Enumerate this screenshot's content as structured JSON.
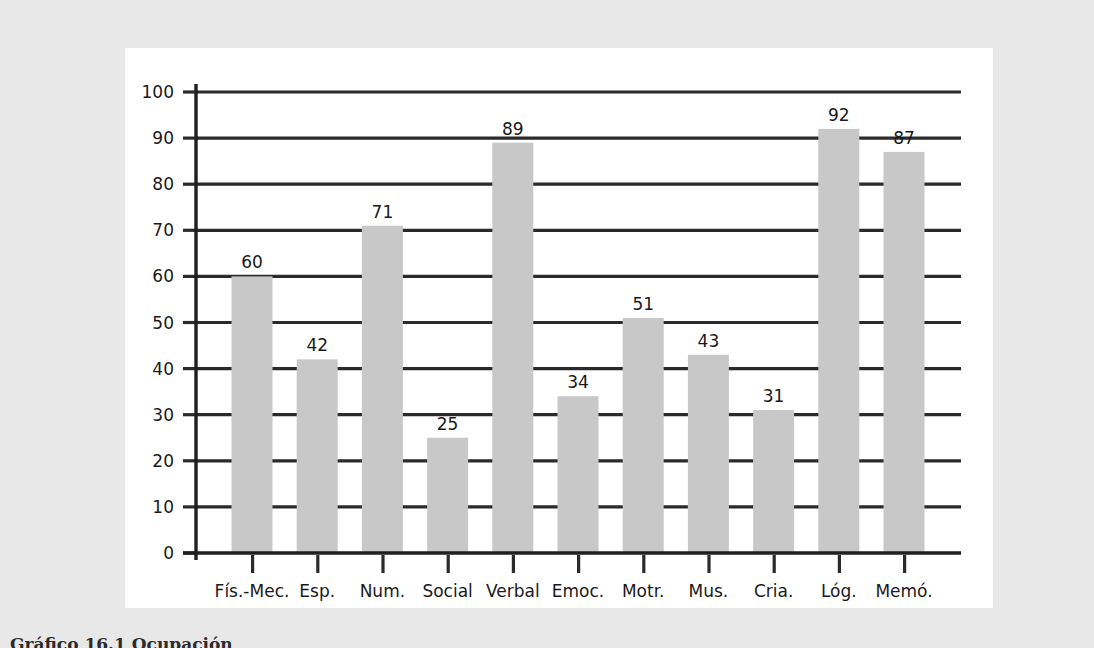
{
  "chart_data": {
    "type": "bar",
    "title": "",
    "xlabel": "",
    "ylabel": "",
    "ylim": [
      0,
      100
    ],
    "ytick_step": 10,
    "grid": true,
    "legend": false,
    "bar_color": "#c8c8c8",
    "axis_color": "#1f1f1f",
    "categories": [
      "Fís.-Mec.",
      "Esp.",
      "Num.",
      "Social",
      "Verbal",
      "Emoc.",
      "Motr.",
      "Mus.",
      "Cria.",
      "Lóg.",
      "Memó."
    ],
    "values": [
      60,
      42,
      71,
      25,
      89,
      34,
      51,
      43,
      31,
      92,
      87
    ],
    "value_labels": [
      "60",
      "42",
      "71",
      "25",
      "89",
      "34",
      "51",
      "43",
      "31",
      "92",
      "87"
    ],
    "ytick_labels": [
      "0",
      "10",
      "20",
      "30",
      "40",
      "50",
      "60",
      "70",
      "80",
      "90",
      "100"
    ],
    "ytick_values": [
      0,
      10,
      20,
      30,
      40,
      50,
      60,
      70,
      80,
      90,
      100
    ]
  },
  "caption": {
    "text": "Gráfico 16.1 Ocupación"
  },
  "colors": {
    "page_background": "#e8e8e8",
    "panel_background": "#ffffff",
    "bar_fill": "#c8c8c8",
    "gridline": "#2a2a2a",
    "text": "#1a1a1a"
  }
}
